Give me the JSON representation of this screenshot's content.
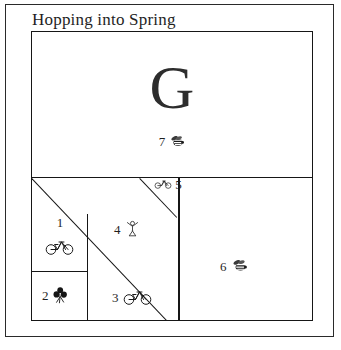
{
  "card": {
    "title": "Hopping into Spring",
    "border_color": "#2a2a2a",
    "background_color": "#ffffff"
  },
  "design_block": {
    "feature_letter": "G",
    "line_color": "#161616",
    "patches": [
      {
        "id": 1,
        "number": "1",
        "motif": "bicycle-icon",
        "motif_glyph": "🚲",
        "layout": "stacked"
      },
      {
        "id": 2,
        "number": "2",
        "motif": "flower-icon",
        "motif_glyph": "⚘",
        "layout": "inline"
      },
      {
        "id": 3,
        "number": "3",
        "motif": "bicycle-icon",
        "motif_glyph": "🚲",
        "layout": "inline"
      },
      {
        "id": 4,
        "number": "4",
        "motif": "figure-icon",
        "motif_glyph": "⚘",
        "layout": "inline"
      },
      {
        "id": 5,
        "number": "5",
        "motif": "bicycle-icon",
        "motif_glyph": "🚲",
        "layout": "stacked"
      },
      {
        "id": 6,
        "number": "6",
        "motif": "bee-icon",
        "motif_glyph": "🐝",
        "layout": "inline"
      },
      {
        "id": 7,
        "number": "7",
        "motif": "bee-icon",
        "motif_glyph": "🐝",
        "layout": "inline"
      }
    ]
  }
}
